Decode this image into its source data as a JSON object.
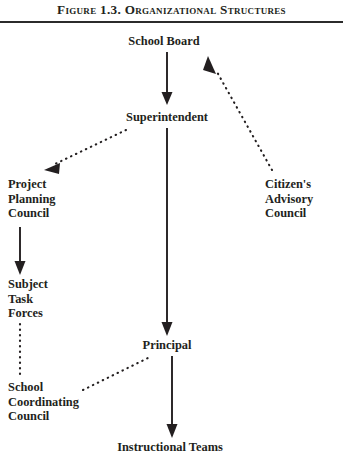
{
  "figure": {
    "title": "Figure 1.3. Organizational Structures",
    "rule_color": "#2b2b2b",
    "text_color": "#231f20",
    "background": "#ffffff"
  },
  "diagram": {
    "type": "organizational-chart",
    "nodes": [
      {
        "id": "school-board",
        "label": "School Board"
      },
      {
        "id": "superintendent",
        "label": "Superintendent"
      },
      {
        "id": "project-planning",
        "label": "Project\nPlanning\nCouncil"
      },
      {
        "id": "citizens-advisory",
        "label": "Citizen's\nAdvisory\nCouncil"
      },
      {
        "id": "subject-task",
        "label": "Subject\nTask\nForces"
      },
      {
        "id": "school-coordinating",
        "label": "School\nCoordinating\nCouncil"
      },
      {
        "id": "principal",
        "label": "Principal"
      },
      {
        "id": "instructional-teams",
        "label": "Instructional Teams"
      }
    ],
    "edges": [
      {
        "from": "school-board",
        "to": "superintendent",
        "style": "solid",
        "arrow": true
      },
      {
        "from": "superintendent",
        "to": "principal",
        "style": "solid",
        "arrow": true
      },
      {
        "from": "principal",
        "to": "instructional-teams",
        "style": "solid",
        "arrow": true
      },
      {
        "from": "project-planning",
        "to": "subject-task",
        "style": "solid",
        "arrow": true
      },
      {
        "from": "superintendent",
        "to": "project-planning",
        "style": "dotted",
        "arrow": true
      },
      {
        "from": "citizens-advisory",
        "to": "school-board",
        "style": "dotted",
        "arrow": true
      },
      {
        "from": "subject-task",
        "to": "school-coordinating",
        "style": "dotted",
        "arrow": false
      },
      {
        "from": "school-coordinating",
        "to": "principal",
        "style": "dotted",
        "arrow": false
      }
    ]
  }
}
